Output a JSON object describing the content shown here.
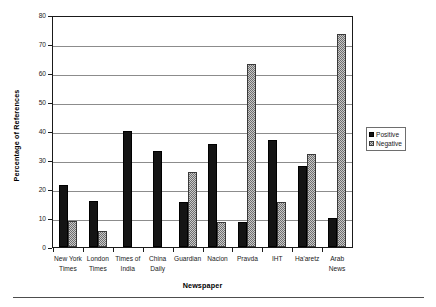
{
  "chart_data": {
    "type": "bar",
    "title": "",
    "xlabel": "Newspaper",
    "ylabel": "Percentage of References",
    "ylim": [
      0,
      80
    ],
    "ytick_step": 10,
    "yticks": [
      80,
      70,
      60,
      50,
      40,
      30,
      20,
      10,
      0
    ],
    "grid": true,
    "legend_position": "right",
    "categories": [
      "New York Times",
      "London Times",
      "Times of India",
      "China Daily",
      "Guardian",
      "Nacion",
      "Pravda",
      "IHT",
      "Ha'aretz",
      "Arab News"
    ],
    "category_lines": [
      [
        "New York",
        "Times"
      ],
      [
        "London",
        "Times"
      ],
      [
        "Times of",
        "India"
      ],
      [
        "China",
        "Daily"
      ],
      [
        "Guardian"
      ],
      [
        "Nacion"
      ],
      [
        "Pravda"
      ],
      [
        "IHT"
      ],
      [
        "Ha'aretz"
      ],
      [
        "Arab",
        "News"
      ]
    ],
    "series": [
      {
        "name": "Positive",
        "color": "#141414",
        "pattern": "solid",
        "values": [
          21.5,
          16,
          40,
          33,
          15.5,
          35.5,
          8.5,
          37,
          28,
          10
        ]
      },
      {
        "name": "Negative",
        "color": "#c9c9c9",
        "pattern": "checker",
        "values": [
          9,
          5.5,
          0,
          0,
          26,
          8.5,
          63,
          15.5,
          32,
          73.5
        ]
      }
    ]
  },
  "legend": {
    "items": [
      {
        "label": "Positive",
        "swatch": "solid-black-square-icon"
      },
      {
        "label": "Negative",
        "swatch": "checkered-gray-square-icon"
      }
    ]
  }
}
